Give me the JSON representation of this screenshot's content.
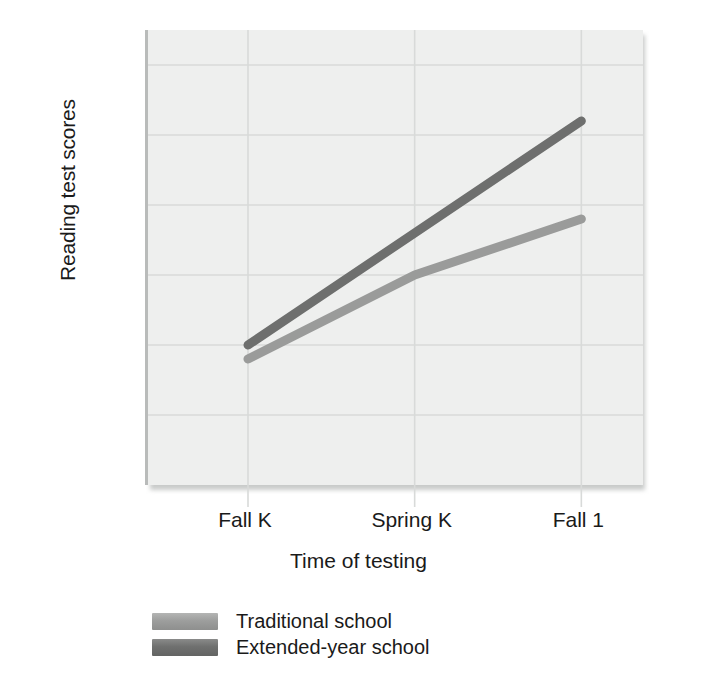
{
  "chart_data": {
    "type": "line",
    "title": "",
    "xlabel": "Time of testing",
    "ylabel": "Reading test scores",
    "categories": [
      "Fall K",
      "Spring K",
      "Fall 1"
    ],
    "series": [
      {
        "name": "Traditional school",
        "values": [
          9,
          15,
          19
        ],
        "color": "#9a9b9a"
      },
      {
        "name": "Extended-year school",
        "values": [
          10,
          18,
          26
        ],
        "color": "#6e6f6e"
      }
    ],
    "yticks": [
      5,
      10,
      15,
      20,
      25,
      30
    ],
    "ylim": [
      0,
      32.5
    ],
    "xlim": [
      -0.6,
      2.37
    ],
    "grid": true,
    "legend_position": "below-left",
    "panel_color": "#eeefee",
    "gridline_color": "#d8dad9"
  },
  "axes": {
    "y_title": "Reading test scores",
    "x_title": "Time of testing",
    "y_tick_labels": [
      "30",
      "25",
      "20",
      "15",
      "10",
      "5"
    ],
    "x_tick_labels": [
      "Fall K",
      "Spring K",
      "Fall 1"
    ]
  },
  "legend": {
    "items": [
      {
        "label": "Traditional school",
        "swatch": "traditional"
      },
      {
        "label": "Extended-year school",
        "swatch": "extended"
      }
    ]
  }
}
